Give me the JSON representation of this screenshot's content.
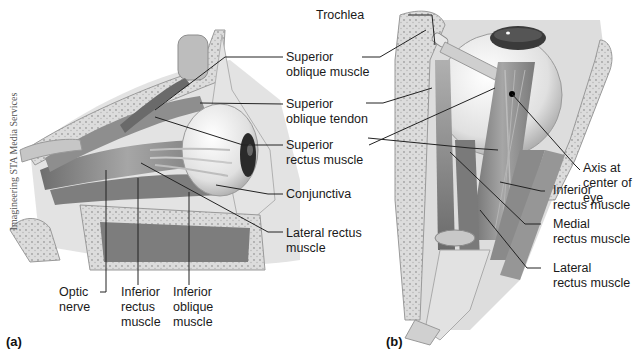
{
  "credit": "Imagineering STA Media Services",
  "panels": {
    "a": {
      "letter": "(a)",
      "labels": {
        "superior_oblique_muscle": [
          "Superior",
          "oblique muscle"
        ],
        "superior_oblique_tendon": [
          "Superior",
          "oblique tendon"
        ],
        "superior_rectus_muscle": [
          "Superior",
          "rectus muscle"
        ],
        "conjunctiva": [
          "Conjunctiva"
        ],
        "lateral_rectus_muscle": [
          "Lateral rectus",
          "muscle"
        ],
        "optic_nerve": [
          "Optic",
          "nerve"
        ],
        "inferior_rectus_muscle": [
          "Inferior",
          "rectus",
          "muscle"
        ],
        "inferior_oblique_muscle": [
          "Inferior",
          "oblique",
          "muscle"
        ]
      }
    },
    "b": {
      "letter": "(b)",
      "labels": {
        "trochlea": [
          "Trochlea"
        ],
        "axis_center_eye": [
          "Axis at",
          "center of",
          "eye"
        ],
        "inferior_rectus_muscle": [
          "Inferior",
          "rectus muscle"
        ],
        "medial_rectus_muscle": [
          "Medial",
          "rectus muscle"
        ],
        "lateral_rectus_muscle": [
          "Lateral",
          "rectus muscle"
        ]
      }
    }
  },
  "colors": {
    "background": "#ffffff",
    "text": "#1a1a1a",
    "leader_line": "#222222",
    "bone": "#d8d8d8",
    "muscle": "#8c8c8c",
    "sclera": "#eeeeee",
    "iris": "#333333"
  }
}
